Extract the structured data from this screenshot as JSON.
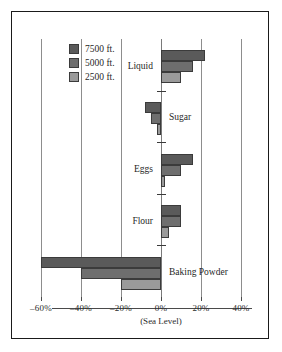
{
  "chart_data": {
    "type": "bar",
    "orientation": "horizontal",
    "title": "",
    "xlabel": "",
    "ylabel": "",
    "xlim": [
      -60,
      40
    ],
    "xticks": [
      -60,
      -40,
      -20,
      0,
      20,
      40
    ],
    "xtick_labels": [
      "–60%",
      "–40%",
      "–20%",
      "0%",
      "20%",
      "40%"
    ],
    "zero_annotation": "(Sea Level)",
    "grid": true,
    "grid_axis": "x",
    "legend_position": "upper left",
    "categories": [
      "Liquid",
      "Sugar",
      "Eggs",
      "Flour",
      "Baking Powder"
    ],
    "series": [
      {
        "name": "7500 ft.",
        "color": "#5a5a5a",
        "values": [
          22,
          -8,
          16,
          10,
          -60
        ]
      },
      {
        "name": "5000 ft.",
        "color": "#6e6e6e",
        "values": [
          16,
          -5,
          10,
          10,
          -40
        ]
      },
      {
        "name": "2500 ft.",
        "color": "#9a9a9a",
        "values": [
          10,
          -2,
          2,
          4,
          -20
        ]
      }
    ]
  },
  "legend": {
    "items": [
      {
        "label": "7500 ft.",
        "color": "#5a5a5a"
      },
      {
        "label": "5000 ft.",
        "color": "#6e6e6e"
      },
      {
        "label": "2500 ft.",
        "color": "#9a9a9a"
      }
    ]
  },
  "axis": {
    "tick_labels": [
      "–60%",
      "–40%",
      "–20%",
      "0%",
      "20%",
      "40%"
    ],
    "sea_level_note": "(Sea Level)"
  },
  "categories": {
    "liquid": "Liquid",
    "sugar": "Sugar",
    "eggs": "Eggs",
    "flour": "Flour",
    "baking_powder": "Baking Powder"
  }
}
